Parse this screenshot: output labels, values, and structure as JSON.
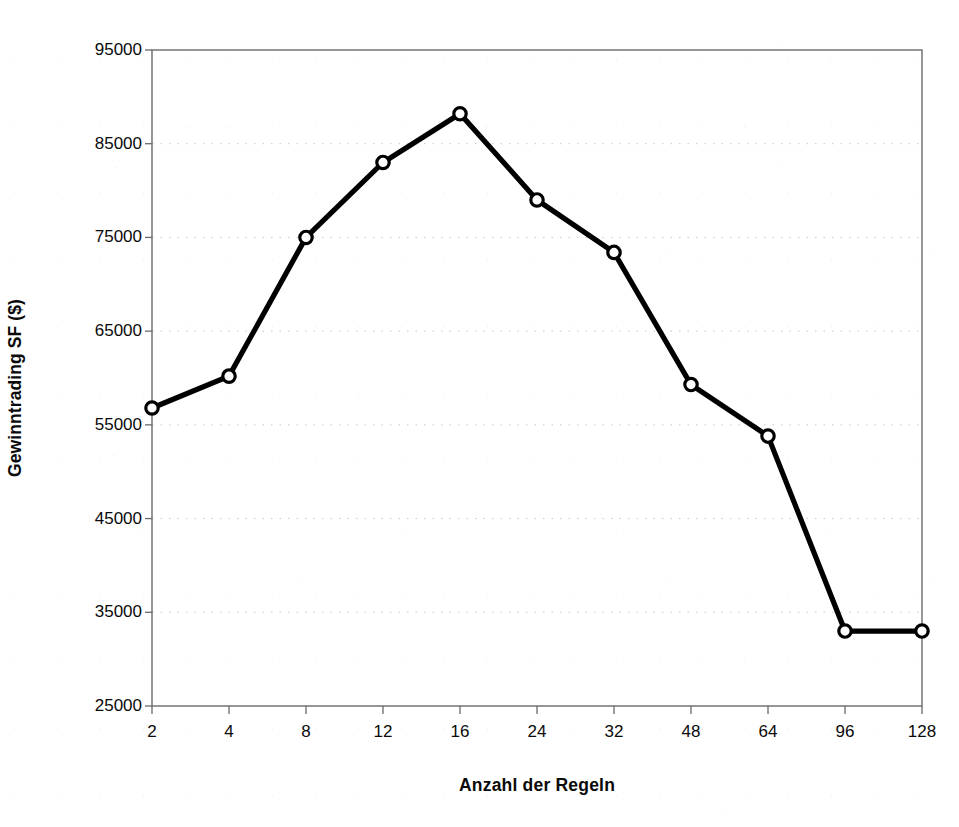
{
  "chart_data": {
    "type": "line",
    "title": "",
    "subtitle": "",
    "xlabel": "Anzahl der Regeln",
    "ylabel": "Gewinntrading SF ($)",
    "categories": [
      "2",
      "4",
      "8",
      "12",
      "16",
      "24",
      "32",
      "48",
      "64",
      "96",
      "128"
    ],
    "values": [
      56800,
      60200,
      75000,
      83000,
      88200,
      79000,
      73400,
      59300,
      53800,
      33000,
      33000
    ],
    "series": [
      {
        "name": "Gewinntrading SF",
        "values": [
          56800,
          60200,
          75000,
          83000,
          88200,
          79000,
          73400,
          59300,
          53800,
          33000,
          33000
        ]
      }
    ],
    "ylim": [
      25000,
      95000
    ],
    "ytick_labels": [
      "95000",
      "85000",
      "75000",
      "65000",
      "55000",
      "45000",
      "35000",
      "25000"
    ],
    "ytick_values": [
      95000,
      85000,
      75000,
      65000,
      55000,
      45000,
      35000,
      25000
    ],
    "xtick_labels": [
      "2",
      "4",
      "8",
      "12",
      "16",
      "24",
      "32",
      "48",
      "64",
      "96",
      "128"
    ],
    "grid": "horizontal-dotted",
    "legend": "none",
    "marker": "open-circle",
    "line_color": "#000000",
    "marker_fill": "#ffffff",
    "grid_color": "#c8c8c8",
    "axis_color": "#555555",
    "background": "#ffffff"
  },
  "axes": {
    "y_title": "Gewinntrading SF ($)",
    "x_title": "Anzahl der Regeln"
  }
}
